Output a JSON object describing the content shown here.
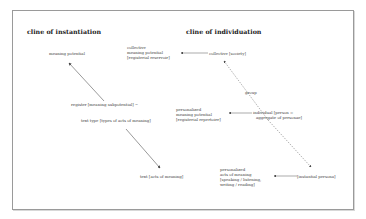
{
  "diagram": {
    "headings": {
      "instantiation": "cline of instantiation",
      "individuation": "cline of individuation"
    },
    "instantiation_nodes": {
      "meaning_potential": "meaning potential",
      "register_line1": "register [meaning subpotential] ~",
      "register_line2": "text type [types of acts of meaning]",
      "text": "text [acts of meaning]"
    },
    "individuation_nodes": {
      "collective_society": "collective [society]",
      "group": "group",
      "individual_line1": "individual [person =",
      "individual_line2": "aggregate of personae]",
      "instantial_persona": "[instantial persona]"
    },
    "middle_nodes": {
      "collective_meaning": [
        "collective",
        "meaning potential",
        "[registerial reservoir]"
      ],
      "personalized_meaning": [
        "personalized",
        "meaning potential",
        "[registerial repertoire]"
      ],
      "personalized_acts": [
        "personalized",
        "acts of meaning",
        "[speaking / listening,",
        "writing / reading]"
      ]
    },
    "colors": {
      "frame": "#9a9a9a",
      "line": "#555555",
      "text": "#444444"
    }
  }
}
